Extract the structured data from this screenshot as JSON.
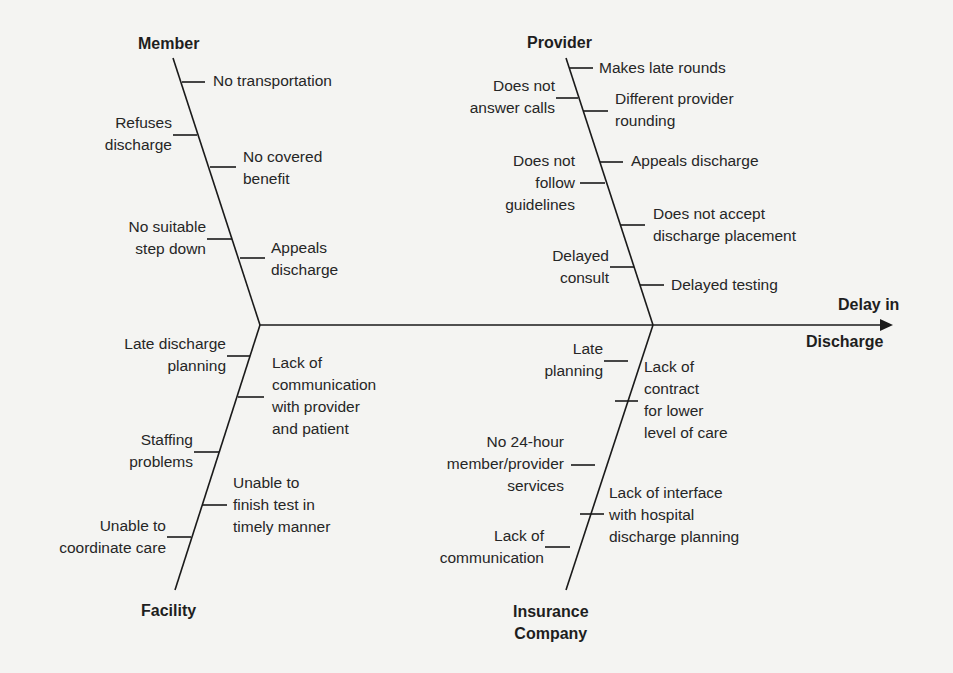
{
  "diagram": {
    "type": "fishbone",
    "effect": {
      "line1": "Delay in",
      "line2": "Discharge"
    },
    "categories": {
      "member": {
        "title": "Member",
        "causes": [
          "No transportation",
          "Refuses\ndischarge",
          "No covered\nbenefit",
          "No suitable\nstep down",
          "Appeals\ndischarge"
        ]
      },
      "provider": {
        "title": "Provider",
        "causes": [
          "Makes late rounds",
          "Does not\nanswer calls",
          "Different provider\nrounding",
          "Appeals discharge",
          "Does not\nfollow\nguidelines",
          "Does not accept\ndischarge placement",
          "Delayed\nconsult",
          "Delayed testing"
        ]
      },
      "facility": {
        "title": "Facility",
        "causes": [
          "Late discharge\nplanning",
          "Lack of\ncommunication\nwith provider\nand patient",
          "Staffing\nproblems",
          "Unable to\nfinish test in\ntimely manner",
          "Unable to\ncoordinate care"
        ]
      },
      "insurance": {
        "title": "Insurance\nCompany",
        "causes": [
          "Late\nplanning",
          "Lack of\ncontract\nfor lower\nlevel of care",
          "No 24-hour\nmember/provider\nservices",
          "Lack of interface\nwith hospital\ndischarge planning",
          "Lack of\ncommunication"
        ]
      }
    },
    "colors": {
      "line": "#1a1a1a",
      "text": "#262626",
      "background": "#f4f4f2"
    }
  }
}
